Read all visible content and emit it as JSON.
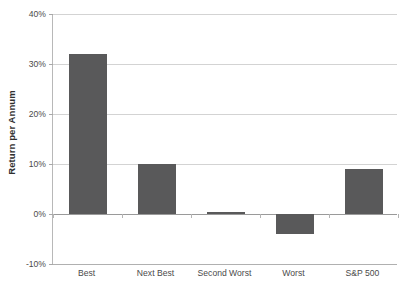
{
  "chart_data": {
    "type": "bar",
    "title": "",
    "subtitle": "",
    "xlabel": "",
    "ylabel": "Return per Annum",
    "categories": [
      "Best",
      "Next Best",
      "Second Worst",
      "Worst",
      "S&P 500"
    ],
    "values": [
      32,
      10,
      0.4,
      -4,
      9
    ],
    "series": [
      {
        "name": "Return per Annum",
        "values": [
          32,
          10,
          0.4,
          -4,
          9
        ]
      }
    ],
    "ylim": [
      -10,
      40
    ],
    "ytick_values": [
      40,
      30,
      20,
      10,
      0,
      -10
    ],
    "ytick_labels": [
      "40%",
      "30%",
      "20%",
      "10%",
      "0%",
      "-10%"
    ],
    "grid": true,
    "legend": false,
    "legend_position": "none",
    "bar_color": "#59595A",
    "gridline_color": "#D3D3D3",
    "axis_color": "#B8B8B8",
    "zero_line_color": "#9A9A9A",
    "background_color": "#FFFFFF",
    "annotations": []
  }
}
